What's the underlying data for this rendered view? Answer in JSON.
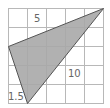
{
  "diagram": {
    "type": "grid-with-shaded-triangle",
    "grid": {
      "cols": 5,
      "rows": 5,
      "line_color": "#b0b0b0",
      "background": "#ffffff"
    },
    "triangle": {
      "fill": "#a8a8a8",
      "stroke": "#555555",
      "vertices_grid_units": [
        [
          5,
          0
        ],
        [
          0,
          2
        ],
        [
          1,
          5
        ]
      ]
    },
    "labels": {
      "top": "5",
      "right": "10",
      "bottom_left": "1.5"
    }
  }
}
